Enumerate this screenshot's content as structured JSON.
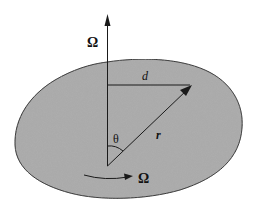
{
  "figure": {
    "colors": {
      "background": "#ffffff",
      "body_fill": "#a9a9a9",
      "stroke": "#1a1a1a"
    },
    "labels": {
      "axis_omega": "Ω",
      "distance": "d",
      "radius": "r",
      "angle": "θ",
      "rotation_omega": "Ω"
    },
    "elements": [
      {
        "id": "rotation-axis",
        "type": "arrow",
        "description": "vertical angular velocity axis"
      },
      {
        "id": "body",
        "type": "blob",
        "description": "shaded rigid body"
      },
      {
        "id": "distance-line",
        "type": "line",
        "description": "perpendicular distance d"
      },
      {
        "id": "position-vector",
        "type": "arrow",
        "description": "position vector r"
      },
      {
        "id": "angle-arc",
        "type": "arc",
        "description": "angle θ between axis and r"
      },
      {
        "id": "rotation-arrow",
        "type": "curved-arrow",
        "description": "sense of rotation Ω"
      }
    ]
  }
}
